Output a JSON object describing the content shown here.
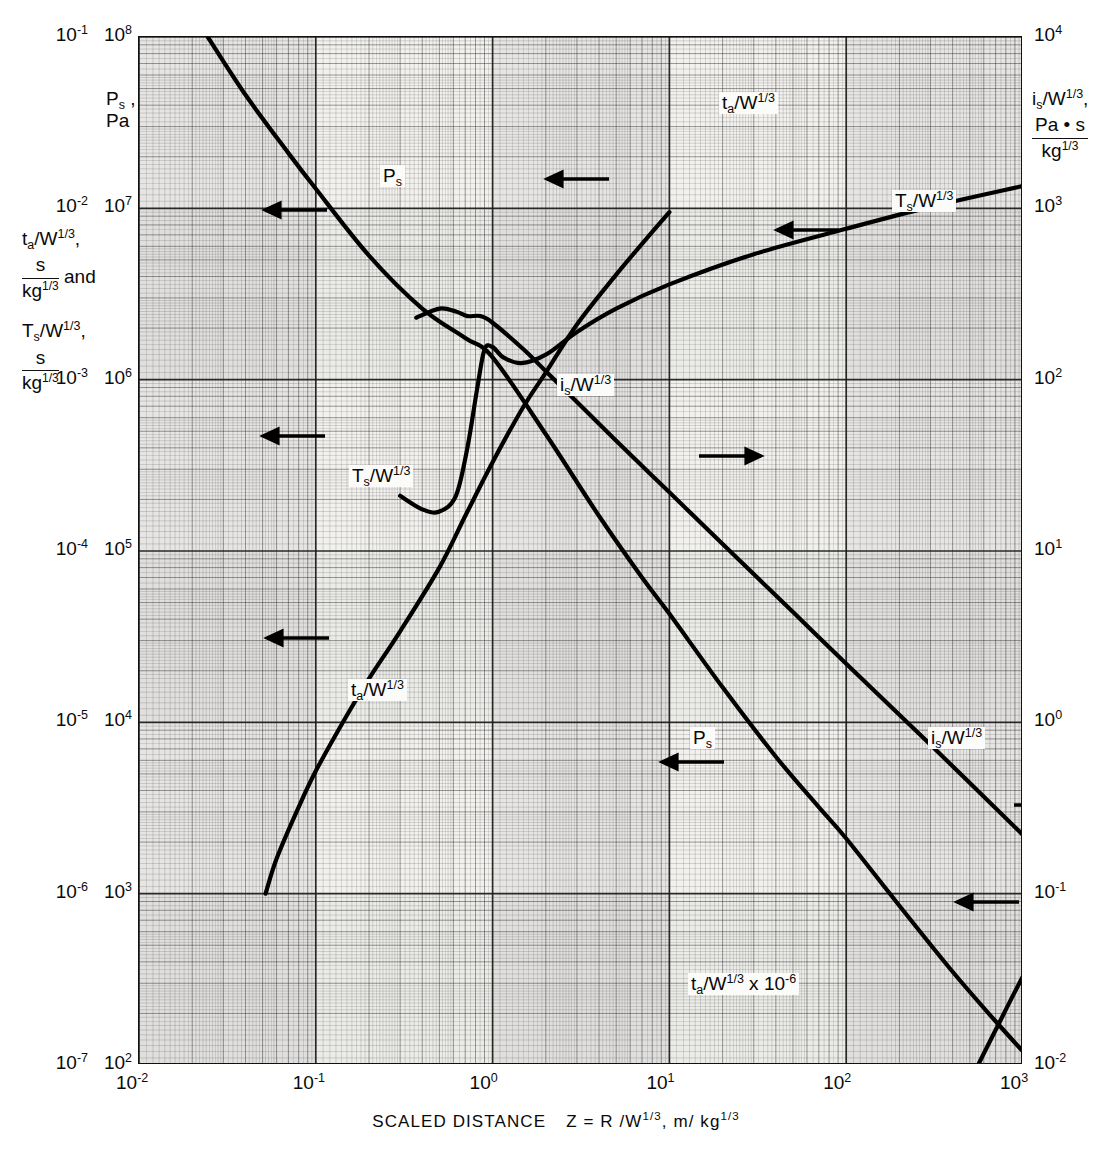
{
  "figure": {
    "type": "log-log engineering chart (blast wave scaled parameters)",
    "xcaption_parts": {
      "prefix": "SCALED DISTANCE",
      "symbol": "Z = R /W",
      "symbol_exp": "1/3",
      "units_sep": ", ",
      "units": "m/ kg",
      "units_exp": "1/3"
    },
    "xcaption_plain": "SCALED DISTANCE  Z = R /W^1/3 , m/ kg^1/3"
  },
  "axes": {
    "x": {
      "scale": "log",
      "min": 0.01,
      "max": 1000,
      "label": "SCALED DISTANCE Z = R/W^1/3, m/kg^1/3",
      "ticks": [
        {
          "base": "10",
          "exp": "-2",
          "value": 0.01
        },
        {
          "base": "10",
          "exp": "-1",
          "value": 0.1
        },
        {
          "base": "10",
          "exp": "0",
          "value": 1
        },
        {
          "base": "10",
          "exp": "1",
          "value": 10
        },
        {
          "base": "10",
          "exp": "2",
          "value": 100
        },
        {
          "base": "10",
          "exp": "3",
          "value": 1000
        }
      ]
    },
    "left_outer": {
      "scale": "log",
      "min": 1e-07,
      "max": 0.1,
      "title_lines": [
        {
          "main": "t",
          "sub": "a",
          "rest": "/W",
          "exp": "1/3",
          "tail": ","
        },
        {
          "frac_num": "s",
          "frac_den": "kg",
          "frac_den_exp": "1/3",
          "tail": " and"
        },
        {
          "main": "T",
          "sub": "s",
          "rest": "/W",
          "exp": "1/3",
          "tail": ","
        },
        {
          "frac_num": "s",
          "frac_den": "kg",
          "frac_den_exp": "1/3",
          "tail": ""
        }
      ],
      "ticks": [
        {
          "base": "10",
          "exp": "-1",
          "value": 0.1
        },
        {
          "base": "10",
          "exp": "-2",
          "value": 0.01
        },
        {
          "base": "10",
          "exp": "-3",
          "value": 0.001
        },
        {
          "base": "10",
          "exp": "-4",
          "value": 0.0001
        },
        {
          "base": "10",
          "exp": "-5",
          "value": 1e-05
        },
        {
          "base": "10",
          "exp": "-6",
          "value": 1e-06
        },
        {
          "base": "10",
          "exp": "-7",
          "value": 1e-07
        }
      ]
    },
    "left_inner": {
      "scale": "log",
      "min": 100,
      "max": 100000000,
      "title_main": "P",
      "title_sub": "s",
      "title_comma": ",",
      "title_units": "Pa",
      "ticks": [
        {
          "base": "10",
          "exp": "8",
          "value": 100000000
        },
        {
          "base": "10",
          "exp": "7",
          "value": 10000000
        },
        {
          "base": "10",
          "exp": "6",
          "value": 1000000
        },
        {
          "base": "10",
          "exp": "5",
          "value": 100000
        },
        {
          "base": "10",
          "exp": "4",
          "value": 10000
        },
        {
          "base": "10",
          "exp": "3",
          "value": 1000
        },
        {
          "base": "10",
          "exp": "2",
          "value": 100
        }
      ]
    },
    "right": {
      "scale": "log",
      "min": 0.01,
      "max": 10000,
      "title_main": "i",
      "title_sub": "s",
      "title_rest": "/W",
      "title_exp": "1/3",
      "title_comma": ",",
      "frac_num": "Pa • s",
      "frac_den": "kg",
      "frac_den_exp": "1/3",
      "ticks": [
        {
          "base": "10",
          "exp": "4",
          "value": 10000
        },
        {
          "base": "10",
          "exp": "3",
          "value": 1000
        },
        {
          "base": "10",
          "exp": "2",
          "value": 100
        },
        {
          "base": "10",
          "exp": "1",
          "value": 10
        },
        {
          "base": "10",
          "exp": "0",
          "value": 1
        },
        {
          "base": "10",
          "exp": "-1",
          "value": 0.1
        },
        {
          "base": "10",
          "exp": "-2",
          "value": 0.01
        }
      ]
    }
  },
  "curve_labels": [
    {
      "id": "ps-upper",
      "main": "P",
      "sub": "s",
      "rest": "",
      "exp": "",
      "tail": ""
    },
    {
      "id": "ta-upper",
      "main": "t",
      "sub": "a",
      "rest": "/W",
      "exp": "1/3",
      "tail": ""
    },
    {
      "id": "ts-upper",
      "main": "T",
      "sub": "s",
      "rest": "/W",
      "exp": "1/3",
      "tail": ""
    },
    {
      "id": "is-mid",
      "main": "i",
      "sub": "s",
      "rest": "/W",
      "exp": "1/3",
      "tail": ""
    },
    {
      "id": "ts-lower",
      "main": "T",
      "sub": "s",
      "rest": "/W",
      "exp": "1/3",
      "tail": ""
    },
    {
      "id": "ta-lower",
      "main": "t",
      "sub": "a",
      "rest": "/W",
      "exp": "1/3",
      "tail": ""
    },
    {
      "id": "ps-lower",
      "main": "P",
      "sub": "s",
      "rest": "",
      "exp": "",
      "tail": ""
    },
    {
      "id": "is-lower",
      "main": "i",
      "sub": "s",
      "rest": "/W",
      "exp": "1/3",
      "tail": ""
    },
    {
      "id": "ta-scaled",
      "main": "t",
      "sub": "a",
      "rest": "/W",
      "exp": "1/3",
      "tail": " x  10",
      "tail_exp": "-6"
    }
  ],
  "chart_data": {
    "type": "line",
    "title": "",
    "xlabel": "SCALED DISTANCE Z = R/W^1/3, m/kg^1/3",
    "ylabel_left": "P_s, Pa  and  t_a/W^1/3, T_s/W^1/3, s/kg^1/3",
    "ylabel_right": "i_s/W^1/3, Pa*s/kg^1/3",
    "xscale": "log",
    "yscale": "log",
    "xlim": [
      0.01,
      1000
    ],
    "ylim_left_inner": [
      100,
      100000000
    ],
    "ylim_left_outer": [
      1e-07,
      0.1
    ],
    "ylim_right": [
      0.01,
      10000
    ],
    "grid": true,
    "legend": "inline curve labels with pointer arrows",
    "series": [
      {
        "name": "P_s",
        "axis": "left_inner",
        "units": "Pa",
        "points": [
          {
            "x": 0.0245,
            "y": 100000000
          },
          {
            "x": 0.04,
            "y": 46000000
          },
          {
            "x": 0.07,
            "y": 21000000
          },
          {
            "x": 0.1,
            "y": 13000000
          },
          {
            "x": 0.2,
            "y": 5300000
          },
          {
            "x": 0.4,
            "y": 2600000
          },
          {
            "x": 0.7,
            "y": 1750000
          },
          {
            "x": 1.0,
            "y": 1350000
          },
          {
            "x": 2.0,
            "y": 480000
          },
          {
            "x": 4.0,
            "y": 160000
          },
          {
            "x": 7.0,
            "y": 70000
          },
          {
            "x": 10,
            "y": 43000
          },
          {
            "x": 20,
            "y": 16000
          },
          {
            "x": 40,
            "y": 6300
          },
          {
            "x": 70,
            "y": 3200
          },
          {
            "x": 100,
            "y": 2100
          },
          {
            "x": 200,
            "y": 850
          },
          {
            "x": 400,
            "y": 350
          },
          {
            "x": 700,
            "y": 180
          },
          {
            "x": 1000,
            "y": 120
          }
        ]
      },
      {
        "name": "t_a/W^1/3",
        "axis": "left_outer",
        "units": "s/kg^1/3",
        "note": "plotted against inner decade labels 10^2..10^8 scaled by 10^-6",
        "points": [
          {
            "x": 0.052,
            "y": 1e-06
          },
          {
            "x": 0.06,
            "y": 1.6e-06
          },
          {
            "x": 0.08,
            "y": 3.2e-06
          },
          {
            "x": 0.1,
            "y": 5.2e-06
          },
          {
            "x": 0.15,
            "y": 1.1e-05
          },
          {
            "x": 0.2,
            "y": 1.8e-05
          },
          {
            "x": 0.3,
            "y": 3.4e-05
          },
          {
            "x": 0.5,
            "y": 8e-05
          },
          {
            "x": 0.7,
            "y": 0.00016
          },
          {
            "x": 1.0,
            "y": 0.00033
          },
          {
            "x": 1.5,
            "y": 0.0007
          },
          {
            "x": 2.0,
            "y": 0.0011
          },
          {
            "x": 3.0,
            "y": 0.0021
          },
          {
            "x": 5.0,
            "y": 0.0041
          },
          {
            "x": 7.0,
            "y": 0.0062
          },
          {
            "x": 10,
            "y": 0.0095
          }
        ]
      },
      {
        "name": "T_s/W^1/3",
        "axis": "left_outer",
        "units": "s/kg^1/3",
        "points": [
          {
            "x": 0.3,
            "y": 0.00021
          },
          {
            "x": 0.4,
            "y": 0.000175
          },
          {
            "x": 0.5,
            "y": 0.00017
          },
          {
            "x": 0.62,
            "y": 0.00021
          },
          {
            "x": 0.72,
            "y": 0.0004
          },
          {
            "x": 0.82,
            "y": 0.0009
          },
          {
            "x": 0.9,
            "y": 0.0015
          },
          {
            "x": 1.0,
            "y": 0.00155
          },
          {
            "x": 1.15,
            "y": 0.00135
          },
          {
            "x": 1.45,
            "y": 0.00125
          },
          {
            "x": 2.0,
            "y": 0.0014
          },
          {
            "x": 3.0,
            "y": 0.0019
          },
          {
            "x": 5.0,
            "y": 0.0026
          },
          {
            "x": 10,
            "y": 0.0036
          },
          {
            "x": 30,
            "y": 0.0054
          },
          {
            "x": 100,
            "y": 0.0076
          },
          {
            "x": 300,
            "y": 0.0102
          },
          {
            "x": 1000,
            "y": 0.0135
          }
        ]
      },
      {
        "name": "i_s/W^1/3",
        "axis": "right",
        "units": "Pa*s/kg^1/3",
        "points": [
          {
            "x": 0.37,
            "y": 230
          },
          {
            "x": 0.5,
            "y": 260
          },
          {
            "x": 0.62,
            "y": 250
          },
          {
            "x": 0.72,
            "y": 235
          },
          {
            "x": 0.85,
            "y": 235
          },
          {
            "x": 1.0,
            "y": 215
          },
          {
            "x": 1.5,
            "y": 150
          },
          {
            "x": 2.0,
            "y": 112
          },
          {
            "x": 3.0,
            "y": 74
          },
          {
            "x": 5.0,
            "y": 44
          },
          {
            "x": 10,
            "y": 22
          },
          {
            "x": 20,
            "y": 11
          },
          {
            "x": 50,
            "y": 4.4
          },
          {
            "x": 100,
            "y": 2.2
          },
          {
            "x": 300,
            "y": 0.74
          },
          {
            "x": 1000,
            "y": 0.22
          }
        ]
      }
    ],
    "annotations": [
      {
        "text": "P_s",
        "points_to": "left_inner axis",
        "arrow": "left"
      },
      {
        "text": "t_a/W^1/3",
        "points_to": "left_outer axis",
        "arrow": "left"
      },
      {
        "text": "T_s/W^1/3",
        "points_to": "left_outer axis",
        "arrow": "left"
      },
      {
        "text": "i_s/W^1/3",
        "points_to": "right axis",
        "arrow": "right"
      },
      {
        "text": "t_a/W^1/3 x 10^-6",
        "points_to": "left_outer axis",
        "arrow": "none"
      }
    ]
  }
}
